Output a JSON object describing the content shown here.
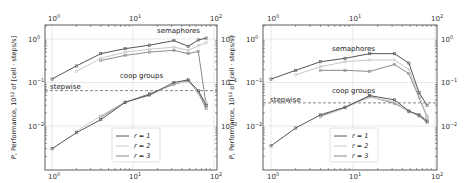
{
  "chart_data": [
    {
      "type": "line",
      "panel": "left",
      "xscale": "log",
      "yscale": "log",
      "xlabel": "grp, cells per thread",
      "ylabel": "P, Performance, 10^12 of [cell · steps/s]",
      "xlim": [
        0.8,
        100
      ],
      "ylim": [
        0.002,
        2
      ],
      "xticks": [
        "10^0",
        "10^1",
        "10^2"
      ],
      "yticks": [
        "10^-2",
        "10^-1",
        "10^0"
      ],
      "grid": true,
      "legend_position": "lower center",
      "legend": [
        "r = 1",
        "r = 2",
        "r = 3"
      ],
      "annotations": [
        {
          "text": "semaphores"
        },
        {
          "text": "coop groups"
        },
        {
          "text": "stepwise"
        }
      ],
      "stepwise_line": 0.065,
      "x": [
        1,
        2,
        4,
        8,
        16,
        32,
        48,
        64,
        80
      ],
      "series": [
        {
          "name": "semaphores r = 1",
          "group": "semaphores",
          "r": 1,
          "x": [
            1,
            2,
            4,
            8,
            16,
            32,
            48,
            64,
            80
          ],
          "values": [
            0.12,
            0.24,
            0.46,
            0.6,
            0.72,
            0.92,
            0.68,
            0.95,
            1.05
          ]
        },
        {
          "name": "semaphores r = 2",
          "group": "semaphores",
          "r": 2,
          "x": [
            2,
            4,
            8,
            16,
            32,
            48,
            64,
            80
          ],
          "values": [
            0.18,
            0.36,
            0.5,
            0.58,
            0.65,
            0.55,
            0.7,
            0.82
          ]
        },
        {
          "name": "semaphores r = 3",
          "group": "semaphores",
          "r": 3,
          "x": [
            4,
            8,
            16,
            32,
            48,
            64,
            80
          ],
          "values": [
            0.32,
            0.42,
            0.5,
            0.55,
            0.46,
            0.52,
            0.03
          ]
        },
        {
          "name": "coop groups r = 1",
          "group": "coop groups",
          "r": 1,
          "x": [
            1,
            2,
            4,
            8,
            16,
            32,
            48,
            64,
            80
          ],
          "values": [
            0.003,
            0.007,
            0.014,
            0.035,
            0.052,
            0.1,
            0.115,
            0.065,
            0.03
          ]
        },
        {
          "name": "coop groups r = 2",
          "group": "coop groups",
          "r": 2,
          "x": [
            2,
            4,
            8,
            16,
            32,
            48,
            64,
            80
          ],
          "values": [
            0.0075,
            0.017,
            0.036,
            0.05,
            0.095,
            0.105,
            0.06,
            0.035
          ]
        },
        {
          "name": "coop groups r = 3",
          "group": "coop groups",
          "r": 3,
          "x": [
            4,
            8,
            16,
            32,
            48,
            64,
            80
          ],
          "values": [
            0.016,
            0.035,
            0.055,
            0.09,
            0.11,
            0.058,
            0.025
          ]
        }
      ]
    },
    {
      "type": "line",
      "panel": "right",
      "xscale": "log",
      "yscale": "log",
      "xlabel": "grp, cells per thread",
      "ylabel": "P, Performance, 10^12 of [cell · steps/s]",
      "xlim": [
        0.8,
        100
      ],
      "ylim": [
        0.002,
        2
      ],
      "xticks": [
        "10^0",
        "10^1",
        "10^2"
      ],
      "yticks": [
        "10^-2",
        "10^-1",
        "10^0"
      ],
      "grid": true,
      "legend_position": "lower center",
      "legend": [
        "r = 1",
        "r = 2",
        "r = 3"
      ],
      "annotations": [
        {
          "text": "semaphores"
        },
        {
          "text": "coop groups"
        },
        {
          "text": "stepwise"
        }
      ],
      "stepwise_line": 0.034,
      "x": [
        1,
        2,
        4,
        8,
        16,
        32,
        48,
        64,
        80
      ],
      "series": [
        {
          "name": "semaphores r = 1",
          "group": "semaphores",
          "r": 1,
          "x": [
            1,
            2,
            4,
            8,
            16,
            32,
            48,
            64,
            80
          ],
          "values": [
            0.12,
            0.19,
            0.3,
            0.36,
            0.46,
            0.46,
            0.28,
            0.058,
            0.03
          ]
        },
        {
          "name": "semaphores r = 2",
          "group": "semaphores",
          "r": 2,
          "x": [
            2,
            4,
            8,
            16,
            32,
            48,
            64,
            80
          ],
          "values": [
            0.15,
            0.23,
            0.3,
            0.33,
            0.33,
            0.2,
            0.05,
            0.017
          ]
        },
        {
          "name": "semaphores r = 3",
          "group": "semaphores",
          "r": 3,
          "x": [
            4,
            8,
            16,
            32,
            48,
            64,
            80
          ],
          "values": [
            0.19,
            0.19,
            0.18,
            0.26,
            0.16,
            0.045,
            0.016
          ]
        },
        {
          "name": "coop groups r = 1",
          "group": "coop groups",
          "r": 1,
          "x": [
            1,
            2,
            4,
            8,
            16,
            32,
            48,
            64,
            80
          ],
          "values": [
            0.0035,
            0.009,
            0.018,
            0.027,
            0.05,
            0.04,
            0.022,
            0.018,
            0.013
          ]
        },
        {
          "name": "coop groups r = 2",
          "group": "coop groups",
          "r": 2,
          "x": [
            4,
            8,
            16,
            32,
            48,
            64,
            80
          ],
          "values": [
            0.016,
            0.026,
            0.046,
            0.036,
            0.021,
            0.018,
            0.014
          ]
        },
        {
          "name": "coop groups r = 3",
          "group": "coop groups",
          "r": 3,
          "x": [
            4,
            8,
            16,
            32,
            48,
            64,
            80
          ],
          "values": [
            0.017,
            0.027,
            0.048,
            0.033,
            0.022,
            0.017,
            0.012
          ]
        }
      ]
    }
  ],
  "style": {
    "colors": {
      "r1": "#555555",
      "r2": "#c8c8c8",
      "r3": "#8a8a8a",
      "grid": "#d8d8d8",
      "stepwise": "#777777"
    }
  },
  "labels": {
    "xlabel": "grp, cells per thread",
    "ylabel": "P, Performance, 10",
    "ylabel_sup": "12",
    "ylabel_rest": " of [cell · steps/s]",
    "semaphores": "semaphores",
    "coop": "coop groups",
    "stepwise": "stepwise",
    "legend": [
      "r = 1",
      "r = 2",
      "r = 3"
    ]
  }
}
